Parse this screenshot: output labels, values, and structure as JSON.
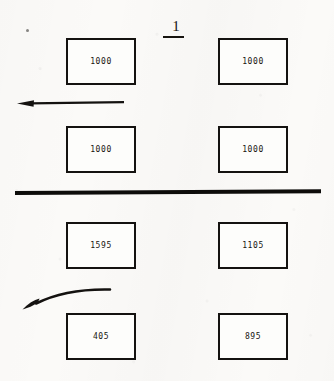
{
  "figure": {
    "number": "1",
    "underlined": true
  },
  "upper_section": {
    "boxes": [
      {
        "id": "upper-left-top",
        "value": "1000",
        "x": 66,
        "y": 38,
        "w": 70,
        "h": 47
      },
      {
        "id": "upper-right-top",
        "value": "1000",
        "x": 218,
        "y": 38,
        "w": 70,
        "h": 47
      },
      {
        "id": "upper-left-bottom",
        "value": "1000",
        "x": 66,
        "y": 126,
        "w": 70,
        "h": 47
      },
      {
        "id": "upper-right-bottom",
        "value": "1000",
        "x": 218,
        "y": 126,
        "w": 70,
        "h": 47
      }
    ],
    "arrow": {
      "type": "straight-arrow-left",
      "direction": "left"
    }
  },
  "divider": {
    "type": "horizontal-rule",
    "color": "#0d0c0a"
  },
  "lower_section": {
    "boxes": [
      {
        "id": "lower-left-top",
        "value": "1595",
        "x": 66,
        "y": 222,
        "w": 70,
        "h": 47
      },
      {
        "id": "lower-right-top",
        "value": "1105",
        "x": 218,
        "y": 222,
        "w": 70,
        "h": 47
      },
      {
        "id": "lower-left-bottom",
        "value": "405",
        "x": 66,
        "y": 313,
        "w": 70,
        "h": 47
      },
      {
        "id": "lower-right-bottom",
        "value": "895",
        "x": 218,
        "y": 313,
        "w": 70,
        "h": 47
      }
    ],
    "arrow": {
      "type": "curved-arrow-left",
      "direction": "left"
    }
  },
  "colors": {
    "paper": "#fbfaf8",
    "ink": "#141210",
    "box_fill": "#fdfdfb"
  }
}
